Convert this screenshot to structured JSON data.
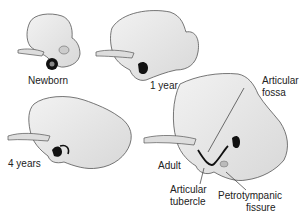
{
  "figure": {
    "stages": [
      {
        "id": "newborn",
        "label": "Newborn"
      },
      {
        "id": "one-year",
        "label": "1 year"
      },
      {
        "id": "four-years",
        "label": "4 years"
      },
      {
        "id": "adult",
        "label": "Adult"
      }
    ],
    "annotations": [
      {
        "id": "articular-fossa",
        "line1": "Articular",
        "line2": "fossa"
      },
      {
        "id": "articular-tubercle",
        "line1": "Articular",
        "line2": "tubercle"
      },
      {
        "id": "petrotympanic-fissure",
        "line1": "Petrotympanic",
        "line2": "fissure"
      }
    ],
    "colors": {
      "bone_fill": "#e9e9e9",
      "bone_stroke": "#555555",
      "dark": "#111111",
      "leader": "#333333"
    }
  }
}
